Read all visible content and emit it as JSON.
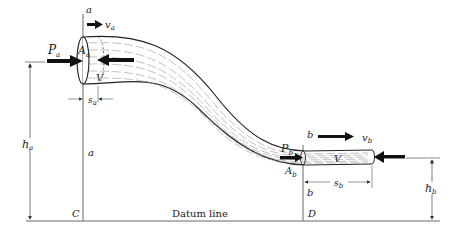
{
  "diagram": {
    "type": "fluid-flow-pipe",
    "labels": {
      "section_a_top": "a",
      "section_a_mid": "a",
      "section_b_top": "b",
      "section_b_mid": "b",
      "velocity_a": "v",
      "velocity_a_sub": "a",
      "velocity_b": "v",
      "velocity_b_sub": "b",
      "pressure_a": "P",
      "pressure_a_sub": "a",
      "pressure_b": "P",
      "pressure_b_sub": "b",
      "area_a": "A",
      "area_a_sub": "a",
      "area_b": "A",
      "area_b_sub": "b",
      "volume_a": "V",
      "volume_b": "V",
      "displacement_a": "s",
      "displacement_a_sub": "a",
      "displacement_b": "s",
      "displacement_b_sub": "b",
      "height_a": "h",
      "height_a_sub": "a",
      "height_b": "h",
      "height_b_sub": "b",
      "point_c": "C",
      "point_d": "D",
      "datum": "Datum line"
    },
    "colors": {
      "stroke": "#222222",
      "streamline": "#888888",
      "background": "#ffffff"
    }
  }
}
